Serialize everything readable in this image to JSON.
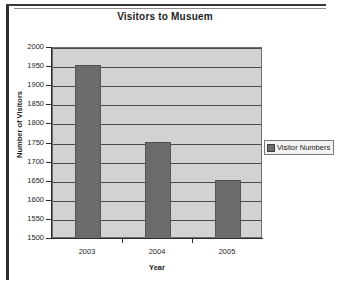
{
  "chart_data": {
    "type": "bar",
    "title": "Visitors to Musuem",
    "xlabel": "Year",
    "ylabel": "Number of Visitors",
    "categories": [
      "2003",
      "2004",
      "2005"
    ],
    "values": [
      1950,
      1750,
      1650
    ],
    "series": [
      {
        "name": "Visitor Numbers",
        "values": [
          1950,
          1750,
          1650
        ]
      }
    ],
    "ylim": [
      1500,
      2000
    ],
    "ytick_step": 50,
    "yticks": [
      2000,
      1950,
      1900,
      1850,
      1800,
      1750,
      1700,
      1650,
      1600,
      1550,
      1500
    ],
    "ytick_labels": [
      "2000",
      "1950",
      "1900",
      "1850",
      "1800",
      "1750",
      "1700",
      "1650",
      "1600",
      "1550",
      "1500"
    ],
    "grid": true,
    "legend": {
      "position": "right",
      "entries": [
        "Visitor Numbers"
      ]
    },
    "colors": {
      "bar": "#6b6b6b",
      "plot_background": "#d2d2d2",
      "gridline": "#4a4a4a",
      "axis": "#2b2b2b",
      "text": "#1d1d1d",
      "figure_background": "#ffffff",
      "frame": "#2e2c2b"
    }
  }
}
